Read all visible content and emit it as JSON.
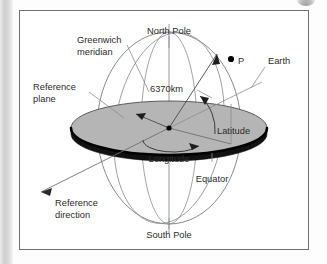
{
  "figure": {
    "type": "geographic-coordinate-sphere-diagram",
    "background_color": "#ffffff",
    "frame_color": "#6f7174",
    "sphere_outline_color": "#7a7d80",
    "plane_fill_color": "#b5b5b5",
    "plane_edge_color": "#101010",
    "label_color": "#2b2b2b",
    "leader_color": "#8a8d90"
  },
  "labels": {
    "north_pole": "North Pole",
    "south_pole": "South Pole",
    "earth": "Earth",
    "point_p": "P",
    "radius": "6370km",
    "latitude": "Latitude",
    "longitude": "Longitude",
    "equator": "Equator",
    "greenwich_meridian_line1": "Greenwich",
    "greenwich_meridian_line2": "meridian",
    "reference_plane_line1": "Reference",
    "reference_plane_line2": "plane",
    "reference_direction_line1": "Reference",
    "reference_direction_line2": "direction"
  },
  "geometry": {
    "sphere_center_x": 165,
    "sphere_center_y": 120,
    "sphere_radius_x": 72,
    "sphere_radius_y": 96,
    "plane_radius_x": 98,
    "plane_radius_y": 27,
    "plane_thickness": 6,
    "radius_value_km": 6370
  }
}
